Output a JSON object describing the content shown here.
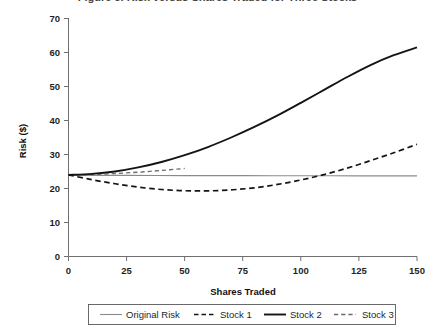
{
  "figure": {
    "title": "Figure 3. Risk versus Shares Traded for Three Stocks",
    "title_truncated": true
  },
  "chart_data": {
    "type": "line",
    "title": "Figure 3. Risk versus Shares Traded for Three Stocks",
    "xlabel": "Shares Traded",
    "ylabel": "Risk ($)",
    "xlim": [
      0,
      150
    ],
    "ylim": [
      0,
      70
    ],
    "xticks": [
      0,
      25,
      50,
      75,
      100,
      125,
      150
    ],
    "yticks": [
      0,
      10,
      20,
      30,
      40,
      50,
      60,
      70
    ],
    "grid": false,
    "legend_position": "below",
    "series": [
      {
        "name": "Original Risk",
        "style": "thin-solid-gray",
        "color": "#8a8a8a",
        "x": [
          0,
          25,
          50,
          75,
          100,
          125,
          150
        ],
        "values": [
          23.9,
          23.85,
          23.8,
          23.78,
          23.75,
          23.72,
          23.7
        ]
      },
      {
        "name": "Stock 1",
        "style": "dashed-black",
        "color": "#141414",
        "x": [
          0,
          10,
          20,
          30,
          40,
          50,
          60,
          70,
          80,
          90,
          100,
          110,
          120,
          130,
          140,
          150
        ],
        "values": [
          24.0,
          22.6,
          21.4,
          20.4,
          19.7,
          19.35,
          19.3,
          19.6,
          20.2,
          21.2,
          22.5,
          24.1,
          26.0,
          28.2,
          30.5,
          33.0
        ]
      },
      {
        "name": "Stock 2",
        "style": "thick-solid-black",
        "color": "#141414",
        "x": [
          0,
          10,
          20,
          30,
          40,
          50,
          60,
          70,
          80,
          90,
          100,
          110,
          120,
          130,
          140,
          150
        ],
        "values": [
          24.0,
          24.3,
          25.0,
          26.2,
          27.8,
          29.8,
          32.2,
          35.0,
          38.1,
          41.5,
          45.2,
          49.0,
          52.8,
          56.3,
          59.2,
          61.5
        ]
      },
      {
        "name": "Stock 3",
        "style": "light-dashed-gray",
        "color": "#6b6b6b",
        "x": [
          0,
          10,
          20,
          30,
          40,
          50
        ],
        "values": [
          24.0,
          24.1,
          24.4,
          24.8,
          25.3,
          25.9
        ]
      }
    ],
    "legend": [
      "Original Risk",
      "Stock 1",
      "Stock 2",
      "Stock 3"
    ]
  }
}
